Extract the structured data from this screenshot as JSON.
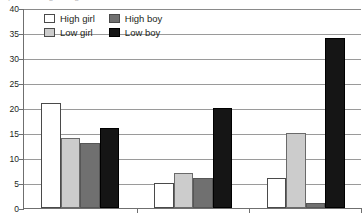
{
  "chart_data": {
    "type": "bar",
    "title": "",
    "xlabel": "",
    "ylabel": "",
    "ylim": [
      0,
      40
    ],
    "yticks": [
      0,
      5,
      10,
      15,
      20,
      25,
      30,
      35,
      40
    ],
    "grid": true,
    "legend_position": "top-left",
    "categories": [
      "Group 1",
      "Group 2",
      "Group 3"
    ],
    "category_labels_visible": false,
    "series": [
      {
        "name": "High girl",
        "color": "#ffffff",
        "values": [
          21,
          5,
          6
        ]
      },
      {
        "name": "Low girl",
        "color": "#cccccc",
        "values": [
          14,
          7,
          15
        ]
      },
      {
        "name": "High boy",
        "color": "#707070",
        "values": [
          13,
          6,
          1
        ]
      },
      {
        "name": "Low boy",
        "color": "#151515",
        "values": [
          16,
          20,
          34
        ]
      }
    ]
  },
  "legend": {
    "items": [
      {
        "label": "High girl",
        "swatch": "s-high-girl"
      },
      {
        "label": "High boy",
        "swatch": "s-high-boy"
      },
      {
        "label": "Low girl",
        "swatch": "s-low-girl"
      },
      {
        "label": "Low boy",
        "swatch": "s-low-boy"
      }
    ]
  },
  "title_strip": {
    "clipped_text": "p value regarding"
  },
  "colors": {
    "axis": "#6f6f6f",
    "gridline": "#9a9a9a",
    "text": "#231f20",
    "plot_background": "#ffffff"
  }
}
